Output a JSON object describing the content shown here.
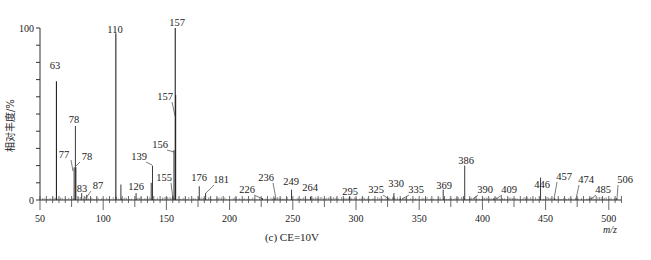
{
  "chart_data": {
    "type": "bar",
    "subtype": "mass-spectrum-stick",
    "title": "",
    "caption": "(c) CE=10V",
    "xlabel": "m/z",
    "ylabel": "相对丰度/%",
    "xlim": [
      50,
      510
    ],
    "ylim": [
      0,
      100
    ],
    "x_ticks": [
      50,
      100,
      150,
      200,
      250,
      300,
      350,
      400,
      450,
      500
    ],
    "y_ticks_labeled": [
      0,
      100
    ],
    "y_minor_tick_step": 10,
    "grid": false,
    "legend": null,
    "peaks": [
      {
        "mz": 63,
        "intensity": 69,
        "label": "63"
      },
      {
        "mz": 77,
        "intensity": 19,
        "label": "77"
      },
      {
        "mz": 78,
        "intensity": 43,
        "label": "78"
      },
      {
        "mz": 78.4,
        "intensity": 19,
        "label": "78"
      },
      {
        "mz": 83,
        "intensity": 4,
        "label": "83"
      },
      {
        "mz": 87,
        "intensity": 3,
        "label": "87"
      },
      {
        "mz": 110,
        "intensity": 97,
        "label": "110"
      },
      {
        "mz": 114,
        "intensity": 9,
        "label": ""
      },
      {
        "mz": 126,
        "intensity": 4,
        "label": "126"
      },
      {
        "mz": 139,
        "intensity": 20,
        "label": "139"
      },
      {
        "mz": 138,
        "intensity": 10,
        "label": ""
      },
      {
        "mz": 155,
        "intensity": 2,
        "label": "155"
      },
      {
        "mz": 156,
        "intensity": 29,
        "label": "156"
      },
      {
        "mz": 157,
        "intensity": 100,
        "label": "157"
      },
      {
        "mz": 157.3,
        "intensity": 61,
        "label": "157"
      },
      {
        "mz": 176,
        "intensity": 8,
        "label": "176"
      },
      {
        "mz": 181,
        "intensity": 4,
        "label": "181"
      },
      {
        "mz": 226,
        "intensity": 1,
        "label": "226"
      },
      {
        "mz": 236,
        "intensity": 1,
        "label": "236"
      },
      {
        "mz": 249,
        "intensity": 6,
        "label": "249"
      },
      {
        "mz": 264,
        "intensity": 2,
        "label": "264"
      },
      {
        "mz": 295,
        "intensity": 2,
        "label": "295"
      },
      {
        "mz": 325,
        "intensity": 1,
        "label": "325"
      },
      {
        "mz": 330,
        "intensity": 4,
        "label": "330"
      },
      {
        "mz": 335,
        "intensity": 1,
        "label": "335"
      },
      {
        "mz": 369,
        "intensity": 6,
        "label": "369"
      },
      {
        "mz": 386,
        "intensity": 20,
        "label": "386"
      },
      {
        "mz": 390,
        "intensity": 1,
        "label": "390"
      },
      {
        "mz": 409,
        "intensity": 1,
        "label": "409"
      },
      {
        "mz": 446,
        "intensity": 13,
        "label": "446"
      },
      {
        "mz": 457,
        "intensity": 1,
        "label": "457"
      },
      {
        "mz": 474,
        "intensity": 1,
        "label": "474"
      },
      {
        "mz": 485,
        "intensity": 1,
        "label": "485"
      },
      {
        "mz": 506,
        "intensity": 1,
        "label": "506"
      }
    ],
    "annotations": [
      {
        "text": "157",
        "mz": 157,
        "x_px": 177,
        "y_px": 26,
        "leader": false
      },
      {
        "text": "110",
        "mz": 110,
        "x_px": 115,
        "y_px": 33,
        "leader": false
      },
      {
        "text": "63",
        "mz": 63,
        "x_px": 55,
        "y_px": 69,
        "leader": false
      },
      {
        "text": "157",
        "mz": 157.3,
        "x_px": 165,
        "y_px": 100,
        "leader": true,
        "leader_to": [
          175,
          116
        ]
      },
      {
        "text": "78",
        "mz": 78,
        "x_px": 74,
        "y_px": 123,
        "leader": false
      },
      {
        "text": "156",
        "mz": 156,
        "x_px": 160,
        "y_px": 148,
        "leader": true,
        "leader_to": [
          174,
          152
        ]
      },
      {
        "text": "77",
        "mz": 77,
        "x_px": 64,
        "y_px": 158,
        "leader": true,
        "leader_to": [
          73,
          171
        ]
      },
      {
        "text": "78",
        "mz": 78.4,
        "x_px": 87,
        "y_px": 160,
        "leader": true,
        "leader_to": [
          76,
          166
        ]
      },
      {
        "text": "139",
        "mz": 139,
        "x_px": 139,
        "y_px": 160,
        "leader": true,
        "leader_to": [
          152,
          165
        ]
      },
      {
        "text": "126",
        "mz": 126,
        "x_px": 136,
        "y_px": 190,
        "leader": false
      },
      {
        "text": "155",
        "mz": 155,
        "x_px": 164,
        "y_px": 181,
        "leader": true,
        "leader_to": [
          173,
          199
        ]
      },
      {
        "text": "83",
        "mz": 83,
        "x_px": 82,
        "y_px": 192,
        "leader": false
      },
      {
        "text": "87",
        "mz": 87,
        "x_px": 98,
        "y_px": 189,
        "leader": true,
        "leader_to": [
          86,
          198
        ]
      },
      {
        "text": "176",
        "mz": 176,
        "x_px": 199,
        "y_px": 181,
        "leader": false
      },
      {
        "text": "181",
        "mz": 181,
        "x_px": 221,
        "y_px": 183,
        "leader": true,
        "leader_to": [
          206,
          193
        ]
      },
      {
        "text": "226",
        "mz": 226,
        "x_px": 247,
        "y_px": 193,
        "leader": true,
        "leader_to": [
          263,
          199
        ]
      },
      {
        "text": "236",
        "mz": 236,
        "x_px": 266,
        "y_px": 181,
        "leader": true,
        "leader_to": [
          276,
          199
        ]
      },
      {
        "text": "249",
        "mz": 249,
        "x_px": 291,
        "y_px": 185,
        "leader": false
      },
      {
        "text": "264",
        "mz": 264,
        "x_px": 310,
        "y_px": 191,
        "leader": false
      },
      {
        "text": "295",
        "mz": 295,
        "x_px": 350,
        "y_px": 195,
        "leader": false
      },
      {
        "text": "325",
        "mz": 325,
        "x_px": 376,
        "y_px": 193,
        "leader": true,
        "leader_to": [
          389,
          199
        ]
      },
      {
        "text": "330",
        "mz": 330,
        "x_px": 396,
        "y_px": 187,
        "leader": false
      },
      {
        "text": "335",
        "mz": 335,
        "x_px": 416,
        "y_px": 193,
        "leader": true,
        "leader_to": [
          402,
          199
        ]
      },
      {
        "text": "369",
        "mz": 369,
        "x_px": 444,
        "y_px": 189,
        "leader": false
      },
      {
        "text": "386",
        "mz": 386,
        "x_px": 466,
        "y_px": 164,
        "leader": false
      },
      {
        "text": "390",
        "mz": 390,
        "x_px": 485,
        "y_px": 193,
        "leader": true,
        "leader_to": [
          473,
          199
        ]
      },
      {
        "text": "409",
        "mz": 409,
        "x_px": 509,
        "y_px": 193,
        "leader": true,
        "leader_to": [
          496,
          199
        ]
      },
      {
        "text": "446",
        "mz": 446,
        "x_px": 542,
        "y_px": 188,
        "leader": false
      },
      {
        "text": "457",
        "mz": 457,
        "x_px": 564,
        "y_px": 180,
        "leader": true,
        "leader_to": [
          554,
          199
        ]
      },
      {
        "text": "474",
        "mz": 474,
        "x_px": 586,
        "y_px": 183,
        "leader": true,
        "leader_to": [
          576,
          199
        ]
      },
      {
        "text": "485",
        "mz": 485,
        "x_px": 603,
        "y_px": 193,
        "leader": true,
        "leader_to": [
          591,
          199
        ]
      },
      {
        "text": "506",
        "mz": 506,
        "x_px": 625,
        "y_px": 183,
        "leader": true,
        "leader_to": [
          617,
          199
        ]
      }
    ],
    "plot_area_px": {
      "x0": 40,
      "x_scale_per_unit": 1.264,
      "y0": 200,
      "y_scale_per_pct": 1.72
    }
  }
}
